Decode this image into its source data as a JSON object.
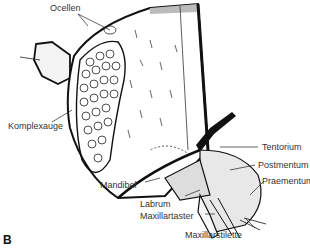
{
  "figure": {
    "panel_label": "B",
    "labels": {
      "ocellen": "Ocellen",
      "komplexauge": "Komplexauge",
      "tentorium": "Tentorium",
      "postmentum": "Postmentum",
      "praementum": "Praementum",
      "mandibel": "Mandibel",
      "labrum": "Labrum",
      "maxillartaster": "Maxillartaster",
      "maxillarstilette": "Maxillarstilette"
    }
  }
}
